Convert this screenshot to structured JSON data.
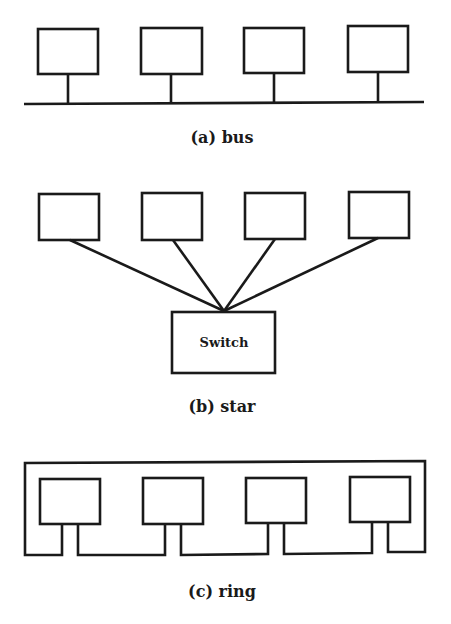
{
  "diagrams": {
    "bus": {
      "caption": "(a) bus",
      "nodes": 4
    },
    "star": {
      "caption": "(b) star",
      "hub_label": "Switch",
      "nodes": 4
    },
    "ring": {
      "caption": "(c) ring",
      "nodes": 4
    }
  },
  "colors": {
    "stroke": "#1a1a1a",
    "background": "#ffffff"
  }
}
